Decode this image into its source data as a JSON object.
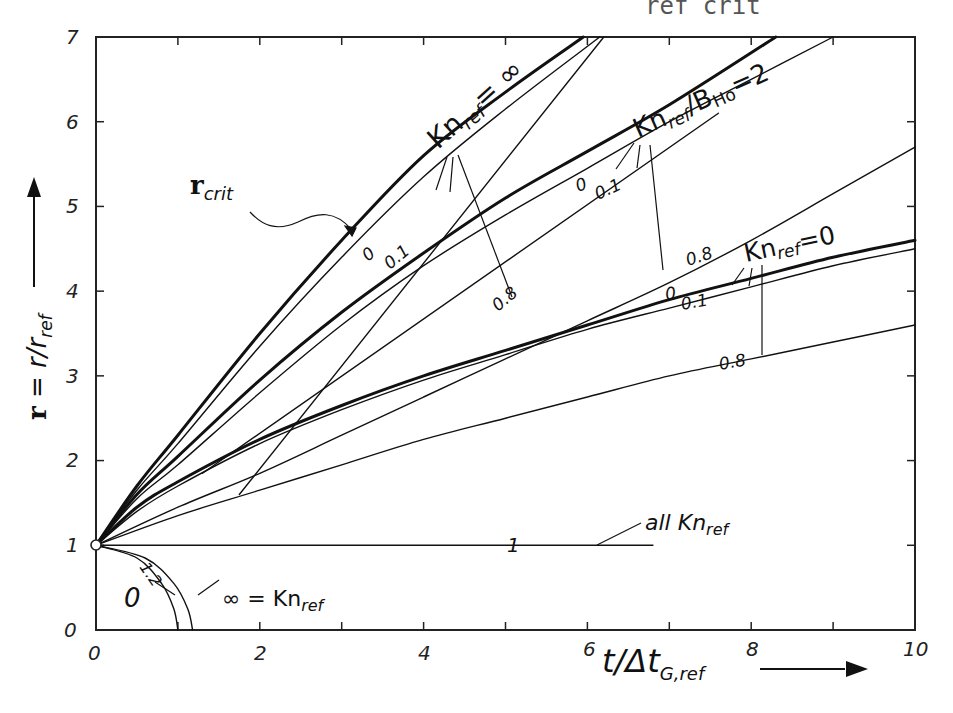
{
  "header_fragment": "ref   crit",
  "chart_data": {
    "type": "line",
    "title": "",
    "xlabel": "t/Δt_G,ref",
    "ylabel": "r = r/r_ref",
    "xlim": [
      0,
      10
    ],
    "ylim": [
      0,
      7
    ],
    "x_ticks": [
      "0",
      "2",
      "4",
      "6",
      "8",
      "10"
    ],
    "y_ticks": [
      "0",
      "1",
      "2",
      "3",
      "4",
      "5",
      "6",
      "7"
    ],
    "grid": false,
    "legend": "inline annotations",
    "series": [
      {
        "name": "Kn_ref = ∞, B = 0",
        "group": "Kn_ref=∞",
        "param": "0",
        "weight": "thick",
        "x": [
          0,
          0.5,
          1,
          2,
          3,
          4,
          5,
          5.95
        ],
        "y": [
          1,
          1.7,
          2.3,
          3.5,
          4.6,
          5.6,
          6.35,
          7
        ]
      },
      {
        "name": "Kn_ref = ∞, B = 0.1",
        "group": "Kn_ref=∞",
        "param": "0.1",
        "weight": "thin",
        "x": [
          0,
          0.5,
          1,
          2,
          3,
          4,
          5,
          6.15
        ],
        "y": [
          1,
          1.65,
          2.2,
          3.35,
          4.4,
          5.35,
          6.15,
          7
        ]
      },
      {
        "name": "Kn_ref/B_Ho = 2, B = 0",
        "group": "Kn_ref/B_Ho=2",
        "param": "0",
        "weight": "thick",
        "x": [
          0,
          0.5,
          1,
          2,
          3,
          4,
          5,
          6,
          7,
          8.3
        ],
        "y": [
          1,
          1.6,
          2.05,
          2.95,
          3.75,
          4.45,
          5.1,
          5.65,
          6.2,
          7
        ]
      },
      {
        "name": "Kn_ref/B_Ho = 2, B = 0.1",
        "group": "Kn_ref/B_Ho=2",
        "param": "0.1",
        "weight": "thin",
        "x": [
          0,
          0.5,
          1,
          2,
          3,
          4,
          5,
          6,
          7,
          8,
          9.0
        ],
        "y": [
          1,
          1.55,
          1.95,
          2.8,
          3.6,
          4.3,
          4.9,
          5.45,
          6.0,
          6.5,
          7
        ]
      },
      {
        "name": "Kn_ref/B_Ho = 2, B = 0.8",
        "group": "Kn_ref/B_Ho=2",
        "param": "0.8",
        "weight": "thin",
        "x": [
          0,
          1,
          2,
          3,
          4,
          5,
          6,
          7,
          8,
          9,
          10
        ],
        "y": [
          1,
          1.45,
          1.85,
          2.3,
          2.75,
          3.2,
          3.65,
          4.1,
          4.6,
          5.15,
          5.7
        ]
      },
      {
        "name": "Kn_ref = 0, B = 0",
        "group": "Kn_ref=0",
        "param": "0",
        "weight": "thick",
        "x": [
          0,
          0.5,
          1,
          2,
          3,
          4,
          5,
          6,
          7,
          8,
          9,
          10
        ],
        "y": [
          1,
          1.45,
          1.75,
          2.25,
          2.65,
          3.0,
          3.3,
          3.6,
          3.9,
          4.15,
          4.4,
          4.6
        ]
      },
      {
        "name": "Kn_ref = 0, B = 0.1",
        "group": "Kn_ref=0",
        "param": "0.1",
        "weight": "thin",
        "x": [
          0,
          0.5,
          1,
          2,
          3,
          4,
          5,
          6,
          7,
          8,
          9,
          10
        ],
        "y": [
          1,
          1.4,
          1.7,
          2.2,
          2.6,
          2.95,
          3.25,
          3.55,
          3.8,
          4.05,
          4.3,
          4.5
        ]
      },
      {
        "name": "Kn_ref = 0, B = 0.8",
        "group": "Kn_ref=0",
        "param": "0.8",
        "weight": "thin",
        "x": [
          0,
          1,
          2,
          3,
          4,
          5,
          6,
          7,
          8,
          9,
          10
        ],
        "y": [
          1,
          1.35,
          1.65,
          1.95,
          2.25,
          2.5,
          2.75,
          3.0,
          3.2,
          3.4,
          3.6
        ]
      },
      {
        "name": "r_crit line (Kn_ref = ∞, B = 0.8)",
        "group": "r_crit",
        "param": "0.8",
        "weight": "thin",
        "x": [
          1.75,
          6.2
        ],
        "y": [
          1.6,
          7.0
        ]
      },
      {
        "name": "r_crit line (Kn_ref/B_Ho = 2)",
        "group": "r_crit",
        "param": "",
        "weight": "thin",
        "x": [
          1.3,
          7.6
        ],
        "y": [
          1.85,
          6.1
        ]
      },
      {
        "name": "all Kn_ref, B = 1",
        "group": "all Kn_ref",
        "param": "1",
        "weight": "thin",
        "x": [
          0,
          6.8
        ],
        "y": [
          1,
          1
        ]
      },
      {
        "name": "B = 1.2, Kn_ref = 0",
        "group": "B=1.2",
        "param": "0",
        "weight": "thin",
        "x": [
          0,
          0.5,
          0.8,
          0.95,
          1.0
        ],
        "y": [
          1,
          0.85,
          0.55,
          0.25,
          0
        ]
      },
      {
        "name": "B = 1.2, Kn_ref = ∞",
        "group": "B=1.2",
        "param": "∞",
        "weight": "thin",
        "x": [
          0,
          0.6,
          0.95,
          1.12,
          1.18
        ],
        "y": [
          1,
          0.85,
          0.55,
          0.25,
          0
        ]
      }
    ],
    "annotations": [
      {
        "text": "Kn_ref = ∞",
        "x": 4.0,
        "y": 5.6
      },
      {
        "text": "Kn_ref/B_Ho = 2",
        "x": 6.5,
        "y": 5.6
      },
      {
        "text": "Kn_ref = 0",
        "x": 7.8,
        "y": 4.1
      },
      {
        "text": "r_crit",
        "x": 1.3,
        "y": 5.3
      },
      {
        "text": "all Kn_ref",
        "x": 7.0,
        "y": 1.3
      },
      {
        "text": "∞ = Kn_ref",
        "x": 1.3,
        "y": 0.3
      },
      {
        "text": "0",
        "x": 0.4,
        "y": 0.4
      },
      {
        "text": "1.2",
        "x": 0.5,
        "y": 0.75
      },
      {
        "text": "1",
        "x": 5.1,
        "y": 1.0
      }
    ]
  },
  "labels": {
    "x_axis": {
      "main": "t/Δt",
      "sub": "G,ref"
    },
    "y_axis": {
      "bold": "r",
      "eq": " = r/r",
      "sub": "ref"
    },
    "ticks_x": [
      "0",
      "2",
      "4",
      "6",
      "8",
      "10"
    ],
    "ticks_y": [
      "0",
      "1",
      "2",
      "3",
      "4",
      "5",
      "6",
      "7"
    ],
    "kn_inf": {
      "kn": "Kn",
      "sub": "ref",
      "eq": "= ∞"
    },
    "kn_b2": {
      "kn": "Kn",
      "sub": "ref",
      "rest": "/B",
      "sub2": "Ho",
      "eq": "=2"
    },
    "kn_zero": {
      "kn": "Kn",
      "sub": "ref",
      "eq": "=0"
    },
    "rcrit": {
      "bold": "r",
      "sub": "crit"
    },
    "all_kn": {
      "pre": "all Kn",
      "sub": "ref"
    },
    "inf_kn": {
      "pre": "∞ = Kn",
      "sub": "ref"
    },
    "curve_params": {
      "p0": "0",
      "p01": "0.1",
      "p08": "0.8",
      "p1": "1",
      "p12": "1.2"
    }
  }
}
